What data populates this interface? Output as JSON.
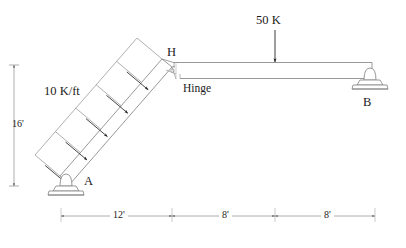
{
  "diagram": {
    "type": "structural-frame-free-body-diagram",
    "title": "",
    "loads": {
      "distributed": {
        "label": "10 K/ft",
        "magnitude": 10,
        "unit": "K/ft",
        "applied_to": "inclined-member-AH",
        "arrow_count": 5,
        "direction": "perpendicular-to-member"
      },
      "point": {
        "label": "50 K",
        "magnitude": 50,
        "unit": "K",
        "applied_to": "horizontal-beam-HB",
        "direction": "downward"
      }
    },
    "nodes": [
      {
        "id": "A",
        "label": "A",
        "support": "pin"
      },
      {
        "id": "H",
        "label": "H",
        "support": "none"
      },
      {
        "id": "B",
        "label": "B",
        "support": "pin"
      }
    ],
    "connections": [
      {
        "label": "Hinge",
        "at": "H",
        "type": "internal-hinge"
      }
    ],
    "dimensions": {
      "vertical": [
        {
          "label": "16'",
          "value": 16,
          "unit": "ft",
          "from": "A",
          "to": "H"
        }
      ],
      "horizontal": [
        {
          "label": "12'",
          "value": 12,
          "unit": "ft",
          "from": "A",
          "to": "H"
        },
        {
          "label": "8'",
          "value": 8,
          "unit": "ft",
          "from": "H",
          "to": "load-50K"
        },
        {
          "label": "8'",
          "value": 8,
          "unit": "ft",
          "from": "load-50K",
          "to": "B"
        }
      ]
    },
    "colors": {
      "line": "#8c8c8c",
      "text": "#1a1a1a",
      "arrow": "#262626",
      "dimension": "#9a9a9a",
      "background": "#ffffff"
    }
  }
}
